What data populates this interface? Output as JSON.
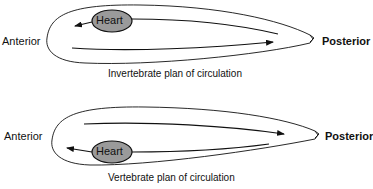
{
  "diagrams": [
    {
      "id": "invertebrate",
      "caption": "Invertebrate plan of circulation",
      "anterior_label": "Anterior",
      "posterior_label": "Posterior",
      "heart_label": "Heart",
      "heart_position": "dorsal"
    },
    {
      "id": "vertebrate",
      "caption": "Vertebrate plan of circulation",
      "anterior_label": "Anterior",
      "posterior_label": "Posterior",
      "heart_label": "Heart",
      "heart_position": "ventral"
    }
  ],
  "colors": {
    "heart_fill": "#9a9a9a",
    "line": "#111111"
  }
}
